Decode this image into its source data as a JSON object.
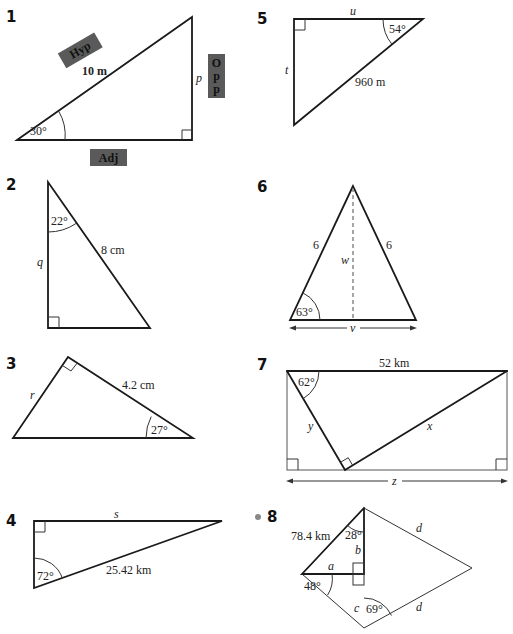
{
  "problems": [
    {
      "number": "1",
      "labels": {
        "hyp_tag": "Hyp",
        "opp_tag_1": "O",
        "opp_tag_2": "p",
        "opp_tag_3": "p",
        "adj_tag": "Adj",
        "hyp": "10 m",
        "opp": "p",
        "angle": "30°"
      }
    },
    {
      "number": "2",
      "labels": {
        "angle": "22°",
        "hyp": "8 cm",
        "side": "q"
      }
    },
    {
      "number": "3",
      "labels": {
        "side": "r",
        "hyp": "4.2 cm",
        "angle": "27°"
      }
    },
    {
      "number": "4",
      "labels": {
        "side": "s",
        "hyp": "25.42 km",
        "angle": "72°"
      }
    },
    {
      "number": "5",
      "labels": {
        "top": "u",
        "side": "t",
        "hyp": "960 m",
        "angle": "54°"
      }
    },
    {
      "number": "6",
      "labels": {
        "left": "6",
        "right": "6",
        "height": "w",
        "base": "v",
        "angle": "63°"
      }
    },
    {
      "number": "7",
      "labels": {
        "top": "52 km",
        "angle": "62°",
        "y": "y",
        "x": "x",
        "base": "z"
      }
    },
    {
      "number": "8",
      "labels": {
        "hyp": "78.4 km",
        "angle_top": "28°",
        "b": "b",
        "a": "a",
        "angle_left": "48°",
        "c": "c",
        "angle_bottom": "69°",
        "d_top": "d",
        "d_bottom": "d"
      }
    }
  ],
  "colors": {
    "tag_fill": "#5a5a5a",
    "bullet": "#888888"
  }
}
